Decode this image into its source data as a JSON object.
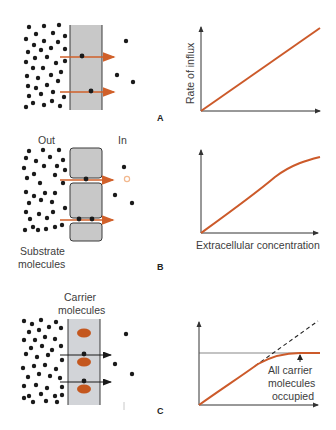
{
  "panels": [
    {
      "letter": "A",
      "name": "simple-diffusion",
      "diagram": {
        "membrane": "continuous lipid bilayer",
        "arrow_color": "#d0602a"
      },
      "graph": {
        "ylabel": "Rate of influx",
        "curve": "linear"
      }
    },
    {
      "letter": "B",
      "name": "channel-diffusion",
      "diagram": {
        "out_label": "Out",
        "in_label": "In",
        "substrate_label_line1": "Substrate",
        "substrate_label_line2": "molecules",
        "arrow_color": "#d0602a"
      },
      "graph": {
        "xlabel": "Extracellular concentration",
        "curve": "slightly saturating"
      }
    },
    {
      "letter": "C",
      "name": "carrier-mediated-transport",
      "diagram": {
        "carrier_label_line1": "Carrier",
        "carrier_label_line2": "molecules",
        "carrier_color": "#c4571e",
        "arrow_color": "#1a1a1a"
      },
      "graph": {
        "annotation_line1": "All carrier",
        "annotation_line2": "molecules",
        "annotation_line3": "occupied",
        "curve": "saturating (plateau)",
        "dashed": "linear extrapolation"
      }
    }
  ],
  "colors": {
    "membrane_fill": "#c8c8c8",
    "membrane_stroke": "#3a3a3a",
    "curve": "#cc5a2a",
    "carrier": "#c4571e",
    "dot": "#1a1a1a"
  }
}
